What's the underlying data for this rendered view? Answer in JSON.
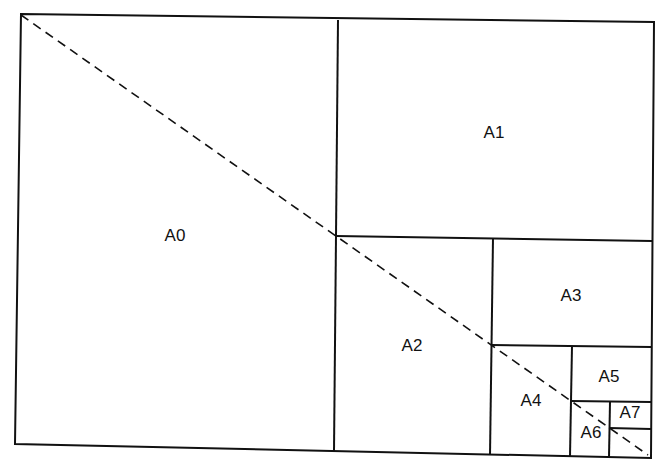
{
  "diagram": {
    "sheets": [
      {
        "label": "A0",
        "x": 175,
        "y": 236
      },
      {
        "label": "A1",
        "x": 494,
        "y": 133
      },
      {
        "label": "A2",
        "x": 412,
        "y": 346
      },
      {
        "label": "A3",
        "x": 571,
        "y": 296
      },
      {
        "label": "A4",
        "x": 531,
        "y": 401
      },
      {
        "label": "A5",
        "x": 609,
        "y": 377
      },
      {
        "label": "A6",
        "x": 591,
        "y": 433
      },
      {
        "label": "A7",
        "x": 630,
        "y": 413
      }
    ],
    "diagonal_style": "dashed",
    "line_color": "#111111"
  }
}
